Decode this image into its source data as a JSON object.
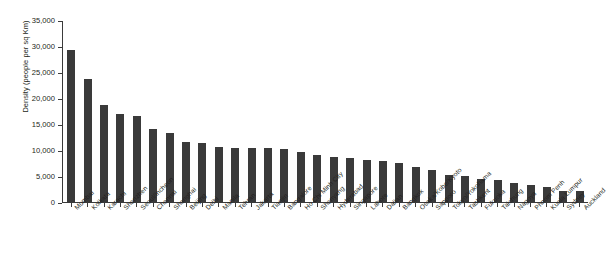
{
  "chart_data": {
    "type": "bar",
    "title": "",
    "subtitle": "",
    "xlabel": "",
    "ylabel": "Density (people per sq Km)",
    "ylim": [
      0,
      35000
    ],
    "ytick_labels": [
      "35,000",
      "30,000",
      "25,000",
      "20,000",
      "15,000",
      "10,000",
      "5,000",
      "0"
    ],
    "ytick_values": [
      35000,
      30000,
      25000,
      20000,
      15000,
      10000,
      5000,
      0
    ],
    "grid": false,
    "legend": "none",
    "orientation": "vertical",
    "bar_color": "#3a3a3a",
    "axis_color": "#3b3b3b",
    "background_color": "#ffffff",
    "categories": [
      "Mumbai",
      "Kolkata",
      "Karachi",
      "Shenzhen",
      "Seoul/Incheon",
      "Chennai",
      "Shanghai",
      "Beijing",
      "Delhi",
      "Manila",
      "Tehran",
      "Jakarta",
      "Tianjin",
      "Bangalore",
      "Ho Chi Minh City",
      "Shenyang",
      "Hyderabad",
      "Singapore",
      "Lahore",
      "Dalian",
      "Bangkok",
      "Osaka/Kobe/Kyoto",
      "Sapporo",
      "Tokyo/Yokohama",
      "Tashkent",
      "Fukuoka",
      "Taichung",
      "Nagoya",
      "Phnom Penh",
      "Kuala Lumpur",
      "Sydney",
      "Auckland"
    ],
    "values": [
      29500,
      23900,
      18900,
      17200,
      16700,
      14300,
      13400,
      11700,
      11500,
      10800,
      10600,
      10500,
      10500,
      10400,
      9900,
      9200,
      8900,
      8600,
      8300,
      8000,
      7600,
      7000,
      6400,
      5300,
      5100,
      4600,
      4400,
      3800,
      3400,
      3000,
      2400,
      2300
    ]
  }
}
